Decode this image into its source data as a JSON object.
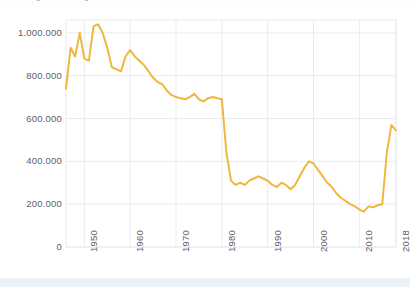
{
  "figure": {
    "caption_clipped": "Abbildung: Entwicklung der Zahl der Geburten in Deutschland",
    "background_color": "#ffffff",
    "bottom_strip_color": "#eaf2f8"
  },
  "chart_data": {
    "type": "line",
    "title": "",
    "xlabel": "",
    "ylabel": "",
    "line_color": "#efb73e",
    "grid": true,
    "grid_color": "#e9ebee",
    "legend": null,
    "legend_position": "none",
    "xlim": [
      1946,
      2018
    ],
    "ylim": [
      0,
      1060000
    ],
    "yticks": [
      0,
      200000,
      400000,
      600000,
      800000,
      1000000
    ],
    "ytick_labels": [
      "0",
      "200.000",
      "400.000",
      "600.000",
      "800.000",
      "1.000.000"
    ],
    "xticks": [
      1950,
      1960,
      1970,
      1980,
      1990,
      2000,
      2010,
      2018
    ],
    "xtick_labels": [
      "1950",
      "1960",
      "1970",
      "1980",
      "1990",
      "2000",
      "2010",
      "2018"
    ],
    "x": [
      1946,
      1947,
      1948,
      1949,
      1950,
      1951,
      1952,
      1953,
      1954,
      1955,
      1956,
      1957,
      1958,
      1959,
      1960,
      1961,
      1962,
      1963,
      1964,
      1965,
      1966,
      1967,
      1968,
      1969,
      1970,
      1971,
      1972,
      1973,
      1974,
      1975,
      1976,
      1977,
      1978,
      1979,
      1980,
      1981,
      1982,
      1983,
      1984,
      1985,
      1986,
      1987,
      1988,
      1989,
      1990,
      1991,
      1992,
      1993,
      1994,
      1995,
      1996,
      1997,
      1998,
      1999,
      2000,
      2001,
      2002,
      2003,
      2004,
      2005,
      2006,
      2007,
      2008,
      2009,
      2010,
      2011,
      2012,
      2013,
      2014,
      2015,
      2016,
      2017,
      2018
    ],
    "values": [
      740000,
      930000,
      890000,
      1000000,
      880000,
      870000,
      1030000,
      1040000,
      1000000,
      930000,
      840000,
      830000,
      820000,
      890000,
      920000,
      890000,
      870000,
      850000,
      820000,
      790000,
      770000,
      760000,
      730000,
      710000,
      700000,
      695000,
      690000,
      700000,
      715000,
      690000,
      680000,
      695000,
      700000,
      695000,
      690000,
      440000,
      310000,
      290000,
      300000,
      290000,
      310000,
      320000,
      330000,
      320000,
      310000,
      290000,
      280000,
      300000,
      290000,
      270000,
      290000,
      330000,
      370000,
      400000,
      390000,
      360000,
      330000,
      300000,
      280000,
      250000,
      230000,
      215000,
      200000,
      190000,
      175000,
      165000,
      190000,
      185000,
      195000,
      200000,
      440000,
      570000,
      545000
    ],
    "notes": [
      "Sharp cliff drop between 1980 and 1982",
      "Local peak around 1953 at ~1.040.000",
      "Minimum around 2011 at ~165.000",
      "Steep rise 2015-2017 to ~570.000"
    ]
  },
  "axes": {
    "ytick_x_right": 62,
    "plot_left": 66,
    "plot_right": 396,
    "plot_top": 20,
    "plot_bottom": 247
  }
}
